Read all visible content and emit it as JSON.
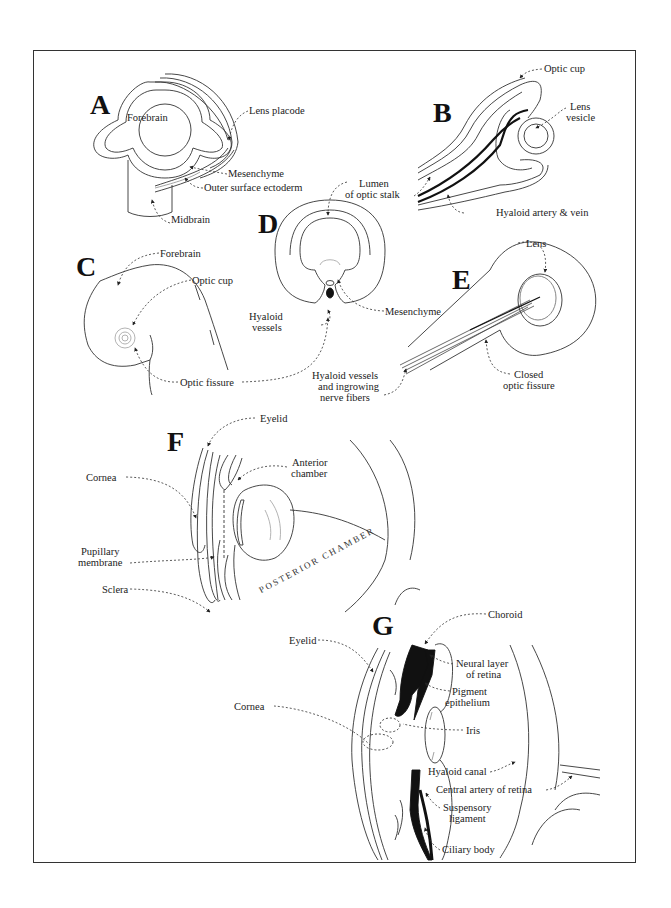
{
  "figure": {
    "panels": [
      {
        "letter": "A",
        "labels": [
          "Forebrain",
          "Lens placode",
          "Mesenchyme",
          "Outer surface ectoderm",
          "Midbrain"
        ]
      },
      {
        "letter": "B",
        "labels": [
          "Optic cup",
          "Lens vesicle",
          "Lumen of optic stalk",
          "Hyaloid artery & vein"
        ]
      },
      {
        "letter": "C",
        "labels": [
          "Forebrain",
          "Optic cup",
          "Optic fissure"
        ]
      },
      {
        "letter": "D",
        "labels": [
          "Lumen of optic stalk",
          "Hyaloid vessels",
          "Mesenchyme",
          "Optic fissure"
        ]
      },
      {
        "letter": "E",
        "labels": [
          "Lens",
          "Hyaloid vessels and ingrowing nerve fibers",
          "Closed optic fissure"
        ]
      },
      {
        "letter": "F",
        "labels": [
          "Eyelid",
          "Anterior chamber",
          "Cornea",
          "Pupillary membrane",
          "Sclera",
          "POSTERIOR CHAMBER"
        ]
      },
      {
        "letter": "G",
        "labels": [
          "Choroid",
          "Eyelid",
          "Neural layer of retina",
          "Pigment epithelium",
          "Cornea",
          "Iris",
          "Hyaloid canal",
          "Central artery of retina",
          "Suspensory ligament",
          "Ciliary body"
        ]
      }
    ]
  },
  "letters": {
    "a": "A",
    "b": "B",
    "c": "C",
    "d": "D",
    "e": "E",
    "f": "F",
    "g": "G"
  },
  "labels": {
    "a_forebrain": "Forebrain",
    "a_lens_placode": "Lens placode",
    "a_mesenchyme": "Mesenchyme",
    "a_outer_ectoderm": "Outer surface ectoderm",
    "a_midbrain": "Midbrain",
    "b_optic_cup": "Optic cup",
    "b_lens_vesicle_1": "Lens",
    "b_lens_vesicle_2": "vesicle",
    "b_hyaloid_av": "Hyaloid artery & vein",
    "d_lumen_1": "Lumen",
    "d_lumen_2": "of optic stalk",
    "c_forebrain": "Forebrain",
    "c_optic_cup": "Optic cup",
    "d_hyaloid_1": "Hyaloid",
    "d_hyaloid_2": "vessels",
    "d_mesenchyme": "Mesenchyme",
    "cd_optic_fissure": "Optic fissure",
    "e_lens": "Lens",
    "e_hyaloid_1": "Hyaloid vessels",
    "e_hyaloid_2": "and ingrowing",
    "e_hyaloid_3": "nerve fibers",
    "e_closed_1": "Closed",
    "e_closed_2": "optic fissure",
    "f_eyelid": "Eyelid",
    "f_anterior_1": "Anterior",
    "f_anterior_2": "chamber",
    "f_cornea": "Cornea",
    "f_pupillary_1": "Pupillary",
    "f_pupillary_2": "membrane",
    "f_sclera": "Sclera",
    "f_posterior": "POSTERIOR CHAMBER",
    "g_choroid": "Choroid",
    "g_eyelid": "Eyelid",
    "g_neural_1": "Neural layer",
    "g_neural_2": "of retina",
    "g_pigment_1": "Pigment",
    "g_pigment_2": "epithelium",
    "g_cornea": "Cornea",
    "g_iris": "Iris",
    "g_hyaloid_canal": "Hyaloid canal",
    "g_central_artery": "Central artery of retina",
    "g_suspensory_1": "Suspensory",
    "g_suspensory_2": "ligament",
    "g_ciliary": "Ciliary body"
  },
  "colors": {
    "line": "#333333",
    "ink": "#111111",
    "background": "#ffffff"
  }
}
